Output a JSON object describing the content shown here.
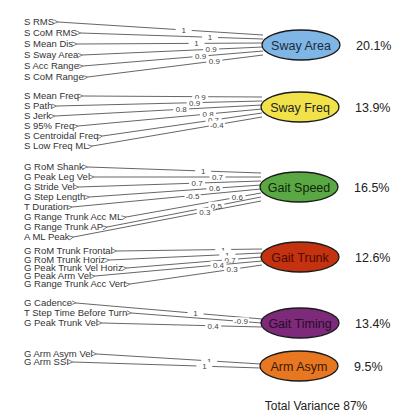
{
  "total_variance": "Total Variance 87%",
  "factors": [
    {
      "name": "Sway Area",
      "variance": "20.1%",
      "fill": "#7fb6e6",
      "text_color": "#1a2a3a",
      "cx": 301,
      "cy": 45,
      "items": [
        {
          "label": "S RMS",
          "loading": "1",
          "y": 22
        },
        {
          "label": "S CoM RMS",
          "loading": "1",
          "y": 33
        },
        {
          "label": "S Mean Dis",
          "loading": "1",
          "y": 44
        },
        {
          "label": "S Sway Area",
          "loading": "0.9",
          "y": 55
        },
        {
          "label": "S Acc Range",
          "loading": "0.9",
          "y": 66
        },
        {
          "label": "S CoM Range",
          "loading": "0.9",
          "y": 77
        }
      ]
    },
    {
      "name": "Sway Freq",
      "variance": "13.9%",
      "fill": "#f2e24a",
      "text_color": "#222",
      "cx": 300,
      "cy": 107,
      "items": [
        {
          "label": "S Mean Freq",
          "loading": "0.9",
          "y": 96
        },
        {
          "label": "S Path",
          "loading": "0.9",
          "y": 106
        },
        {
          "label": "S Jerk",
          "loading": "0.8",
          "y": 116
        },
        {
          "label": "S 95% Freq",
          "loading": "0.8",
          "y": 126
        },
        {
          "label": "S Centroidal Freq",
          "loading": "0.7",
          "y": 136
        },
        {
          "label": "S Low Freq ML",
          "loading": "-0.4",
          "y": 146
        }
      ]
    },
    {
      "name": "Gait Speed",
      "variance": "16.5%",
      "fill": "#5aa843",
      "text_color": "#10260a",
      "cx": 299,
      "cy": 187,
      "items": [
        {
          "label": "G RoM Shank",
          "loading": "1",
          "y": 167
        },
        {
          "label": "G Peak Leg Vel",
          "loading": "0.7",
          "y": 177
        },
        {
          "label": "G Stride Vel",
          "loading": "0.7",
          "y": 187
        },
        {
          "label": "G Step Length",
          "loading": "0.6",
          "y": 197
        },
        {
          "label": "T Duration",
          "loading": "-0.5",
          "y": 207
        },
        {
          "label": "G Range Trunk Acc ML",
          "loading": "0.6",
          "y": 217
        },
        {
          "label": "G Range Trunk AP",
          "loading": "0.5",
          "y": 227
        },
        {
          "label": "A ML Peak",
          "loading": "0.3",
          "y": 237
        }
      ]
    },
    {
      "name": "Gait Trunk",
      "variance": "12.6%",
      "fill": "#c4320f",
      "text_color": "#4a0a00",
      "cx": 300,
      "cy": 257,
      "items": [
        {
          "label": "G RoM Trunk Frontal",
          "loading": "1",
          "y": 251
        },
        {
          "label": "G RoM Trunk Horiz",
          "loading": "1",
          "y": 260
        },
        {
          "label": "G Peak Trunk Vel Horiz",
          "loading": "0.7",
          "y": 268
        },
        {
          "label": "G Peak Arm Vel",
          "loading": "0.4",
          "y": 276
        },
        {
          "label": "G Range Trunk Acc Vert",
          "loading": "0.3",
          "y": 284
        }
      ]
    },
    {
      "name": "Gait Timing",
      "variance": "13.4%",
      "fill": "#7d2a7a",
      "text_color": "#2a0a2a",
      "cx": 300,
      "cy": 323,
      "items": [
        {
          "label": "G Cadence",
          "loading": "1",
          "y": 303
        },
        {
          "label": "T Step Time Before Turn",
          "loading": "-0.9",
          "y": 313
        },
        {
          "label": "G Peak Trunk Vel",
          "loading": "0.4",
          "y": 323
        }
      ]
    },
    {
      "name": "Arm Asym",
      "variance": "9.5%",
      "fill": "#e87722",
      "text_color": "#3a1a00",
      "cx": 299,
      "cy": 366,
      "items": [
        {
          "label": "G Arm Asym Vel",
          "loading": "1",
          "y": 354
        },
        {
          "label": "G Arm SSI",
          "loading": "1",
          "y": 362
        }
      ]
    }
  ],
  "chart_data": {
    "type": "path-diagram",
    "title": "",
    "factors": [
      {
        "name": "Sway Area",
        "variance_pct": 20.1,
        "loadings": {
          "S RMS": 1,
          "S CoM RMS": 1,
          "S Mean Dis": 1,
          "S Sway Area": 0.9,
          "S Acc Range": 0.9,
          "S CoM Range": 0.9
        }
      },
      {
        "name": "Sway Freq",
        "variance_pct": 13.9,
        "loadings": {
          "S Mean Freq": 0.9,
          "S Path": 0.9,
          "S Jerk": 0.8,
          "S 95% Freq": 0.8,
          "S Centroidal Freq": 0.7,
          "S Low Freq ML": -0.4
        }
      },
      {
        "name": "Gait Speed",
        "variance_pct": 16.5,
        "loadings": {
          "G RoM Shank": 1,
          "G Peak Leg Vel": 0.7,
          "G Stride Vel": 0.7,
          "G Step Length": 0.6,
          "T Duration": -0.5,
          "G Range Trunk Acc ML": 0.6,
          "G Range Trunk AP": 0.5,
          "A ML Peak": 0.3
        }
      },
      {
        "name": "Gait Trunk",
        "variance_pct": 12.6,
        "loadings": {
          "G RoM Trunk Frontal": 1,
          "G RoM Trunk Horiz": 1,
          "G Peak Trunk Vel Horiz": 0.7,
          "G Peak Arm Vel": 0.4,
          "G Range Trunk Acc Vert": 0.3
        }
      },
      {
        "name": "Gait Timing",
        "variance_pct": 13.4,
        "loadings": {
          "G Cadence": 1,
          "T Step Time Before Turn": -0.9,
          "G Peak Trunk Vel": 0.4
        }
      },
      {
        "name": "Arm Asym",
        "variance_pct": 9.5,
        "loadings": {
          "G Arm Asym Vel": 1,
          "G Arm SSI": 1
        }
      }
    ],
    "total_variance_pct": 87
  }
}
